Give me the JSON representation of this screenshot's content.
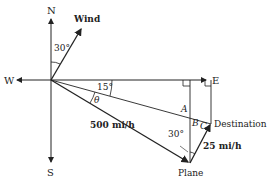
{
  "diagram": {
    "type": "vector-navigation",
    "compass": {
      "north": "N",
      "south": "S",
      "east": "E",
      "west": "W"
    },
    "vectors": {
      "wind": {
        "label": "Wind",
        "angle_from_north": "30°"
      },
      "plane": {
        "label": "500 mi/h"
      },
      "wind_component": {
        "label": "25 mi/h"
      }
    },
    "angles": {
      "east_to_destination": "15°",
      "theta": "θ",
      "at_plane": "30°"
    },
    "points": {
      "destination": "Destination",
      "plane": "Plane",
      "A": "A",
      "B": "B",
      "C": "C"
    },
    "colors": {
      "line": "#222222",
      "background": "#ffffff"
    }
  }
}
